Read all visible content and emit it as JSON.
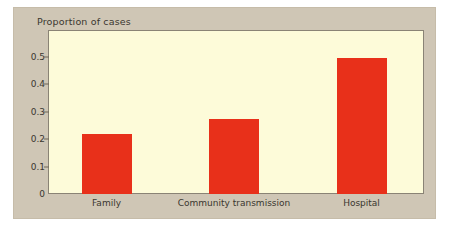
{
  "chart_data": {
    "type": "bar",
    "title": "Proportion of cases",
    "xlabel": "",
    "ylabel": "Proportion of cases",
    "categories": [
      "Family",
      "Community transmission",
      "Hospital"
    ],
    "values": [
      0.22,
      0.275,
      0.495
    ],
    "ytick_labels": [
      "0",
      "0.1",
      "0.2",
      "0.3",
      "0.4",
      "0.5"
    ],
    "ytick_values": [
      0,
      0.1,
      0.2,
      0.3,
      0.4,
      0.5
    ],
    "ylim": [
      0,
      0.585
    ],
    "grid": false,
    "legend": false,
    "bar_color": "#e8301a",
    "plot_background": "#fdfbd9",
    "panel_background": "#cfc6b5",
    "axis_color": "#8a8375",
    "text_color": "#3a362f"
  }
}
